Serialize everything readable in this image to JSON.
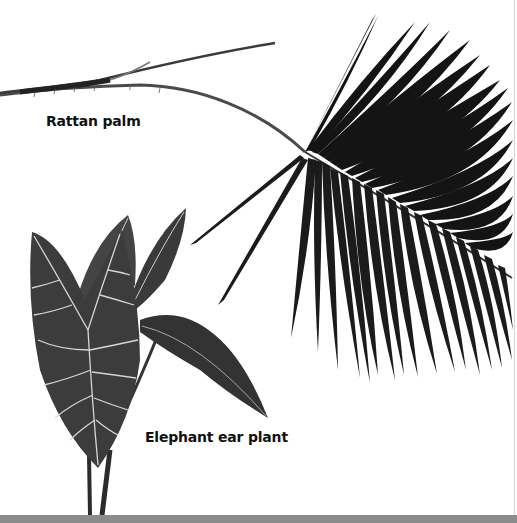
{
  "page": {
    "background": "#ffffff",
    "bottom_bar_color": "#8b8b8b"
  },
  "labels": {
    "rattan_palm": "Rattan palm",
    "elephant_ear_plant": "Elephant ear plant"
  },
  "illustrations": [
    {
      "name": "rattan-palm-frond",
      "description": "Black-and-white photo of a rattan palm frond with long spiny stem and drooping leaflets"
    },
    {
      "name": "elephant-ear-plant",
      "description": "Black-and-white photo of an elephant ear plant with arrow-shaped leaves with pale veins"
    }
  ],
  "colors": {
    "leaf_dark": "#1a1a1a",
    "leaf_mid": "#3a3a3a",
    "vein": "#d8d8d8",
    "stem": "#2b2b2b"
  }
}
